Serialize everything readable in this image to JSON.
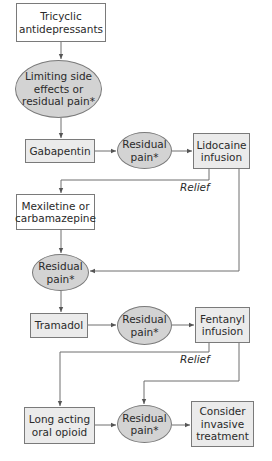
{
  "diagram": {
    "nodes": [
      {
        "id": "tricyclic",
        "shape": "box",
        "text": "Tricyclic\nantidepressants"
      },
      {
        "id": "limiting",
        "shape": "ellipse",
        "text": "Limiting side\neffects or\nresidual pain*"
      },
      {
        "id": "gabapentin",
        "shape": "box",
        "text": "Gabapentin"
      },
      {
        "id": "residual1",
        "shape": "ellipse",
        "text": "Residual\npain*"
      },
      {
        "id": "lidocaine",
        "shape": "box",
        "text": "Lidocaine\ninfusion"
      },
      {
        "id": "mexiletine",
        "shape": "box",
        "text": "Mexiletine or\ncarbamazepine"
      },
      {
        "id": "residual2",
        "shape": "ellipse",
        "text": "Residual\npain*"
      },
      {
        "id": "tramadol",
        "shape": "box",
        "text": "Tramadol"
      },
      {
        "id": "residual3",
        "shape": "ellipse",
        "text": "Residual\npain*"
      },
      {
        "id": "fentanyl",
        "shape": "box",
        "text": "Fentanyl\ninfusion"
      },
      {
        "id": "longacting",
        "shape": "box",
        "text": "Long acting\noral opioid"
      },
      {
        "id": "residual4",
        "shape": "ellipse",
        "text": "Residual\npain*"
      },
      {
        "id": "invasive",
        "shape": "box",
        "text": "Consider\ninvasive\ntreatment"
      }
    ],
    "edge_labels": {
      "relief1": "Relief",
      "relief2": "Relief"
    },
    "edges": [
      {
        "from": "tricyclic",
        "to": "limiting"
      },
      {
        "from": "limiting",
        "to": "gabapentin"
      },
      {
        "from": "gabapentin",
        "to": "residual1"
      },
      {
        "from": "residual1",
        "to": "lidocaine"
      },
      {
        "from": "lidocaine",
        "to": "mexiletine",
        "label": "Relief"
      },
      {
        "from": "lidocaine",
        "to": "residual2"
      },
      {
        "from": "mexiletine",
        "to": "residual2"
      },
      {
        "from": "residual2",
        "to": "tramadol"
      },
      {
        "from": "tramadol",
        "to": "residual3"
      },
      {
        "from": "residual3",
        "to": "fentanyl"
      },
      {
        "from": "fentanyl",
        "to": "longacting",
        "label": "Relief"
      },
      {
        "from": "fentanyl",
        "to": "residual4"
      },
      {
        "from": "longacting",
        "to": "residual4"
      },
      {
        "from": "residual4",
        "to": "invasive"
      }
    ],
    "colors": {
      "box_fill": "#ebebeb",
      "ellipse_fill": "#d3d3d3",
      "stroke": "#7a7a7a",
      "text": "#2a2a2a"
    }
  }
}
